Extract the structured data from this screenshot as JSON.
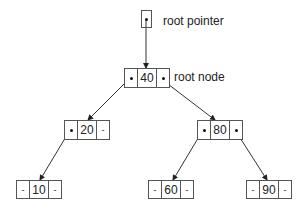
{
  "diagram": {
    "type": "binary-search-tree",
    "labels": {
      "root_pointer": "root pointer",
      "root_node": "root node"
    },
    "null_symbol": "-",
    "nodes": [
      {
        "id": "n40",
        "key": "40",
        "left": "n20",
        "right": "n80"
      },
      {
        "id": "n20",
        "key": "20",
        "left": "n10",
        "right": null
      },
      {
        "id": "n80",
        "key": "80",
        "left": "n60",
        "right": "n90"
      },
      {
        "id": "n10",
        "key": "10",
        "left": null,
        "right": null
      },
      {
        "id": "n60",
        "key": "60",
        "left": null,
        "right": null
      },
      {
        "id": "n90",
        "key": "90",
        "left": null,
        "right": null
      }
    ],
    "edges": [
      {
        "from": "root_pointer",
        "to": "n40"
      },
      {
        "from": "n40",
        "to": "n20"
      },
      {
        "from": "n40",
        "to": "n80"
      },
      {
        "from": "n20",
        "to": "n10"
      },
      {
        "from": "n80",
        "to": "n60"
      },
      {
        "from": "n80",
        "to": "n90"
      }
    ]
  }
}
